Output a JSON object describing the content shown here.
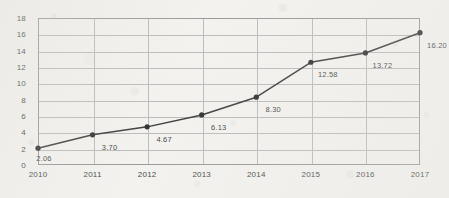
{
  "chart_data": {
    "type": "line",
    "title": "",
    "subtitle": "",
    "xlabel": "",
    "ylabel": "",
    "categories": [
      "2010",
      "2011",
      "2012",
      "2013",
      "2014",
      "2015",
      "2016",
      "2017"
    ],
    "values": [
      2.06,
      3.7,
      4.67,
      6.13,
      8.3,
      12.58,
      13.72,
      16.2
    ],
    "point_labels": [
      "2.06",
      "3.70",
      "4.67",
      "6.13",
      "8.30",
      "12.58",
      "13.72",
      "16.20"
    ],
    "ylim": [
      0,
      18
    ],
    "ytick_values": [
      0,
      2,
      4,
      6,
      8,
      10,
      12,
      14,
      16,
      18
    ],
    "ytick_labels": [
      "0",
      "2",
      "4",
      "6",
      "8",
      "10",
      "12",
      "14",
      "16",
      "18"
    ],
    "grid": "horizontal-and-vertical",
    "legend": "none",
    "series": [
      {
        "name": "series-1",
        "values": [
          2.06,
          3.7,
          4.67,
          6.13,
          8.3,
          12.58,
          13.72,
          16.2
        ]
      }
    ],
    "marker": "circle",
    "line_color": "#3f3f3f",
    "marker_color": "#333333",
    "grid_color": "#bcbcbc",
    "axis_color": "#9a9a9a",
    "label_color": "#4a4a4a",
    "background_color": "#f3f2ef"
  }
}
